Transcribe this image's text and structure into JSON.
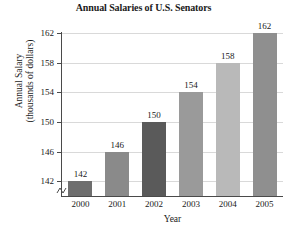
{
  "chart_data": {
    "type": "bar",
    "title": "Annual Salaries of U.S. Senators",
    "xlabel": "Year",
    "ylabel_line1": "Annual Salary",
    "ylabel_line2": "(thousands of dollars)",
    "categories": [
      "2000",
      "2001",
      "2002",
      "2003",
      "2004",
      "2005"
    ],
    "values": [
      142,
      146,
      150,
      154,
      158,
      162
    ],
    "value_labels": [
      "142",
      "146",
      "150",
      "154",
      "158",
      "162"
    ],
    "bar_colors": [
      "#6e6e6e",
      "#8a8a8a",
      "#5a5a5a",
      "#9a9a9a",
      "#b9b9b9",
      "#8f8f8f"
    ],
    "yticks": [
      142,
      146,
      150,
      154,
      158,
      162
    ],
    "ytick_labels": [
      "142",
      "146",
      "150",
      "154",
      "158",
      "162"
    ],
    "ylim": [
      140,
      162
    ],
    "axis_break": true,
    "grid": true,
    "legend": "none"
  }
}
